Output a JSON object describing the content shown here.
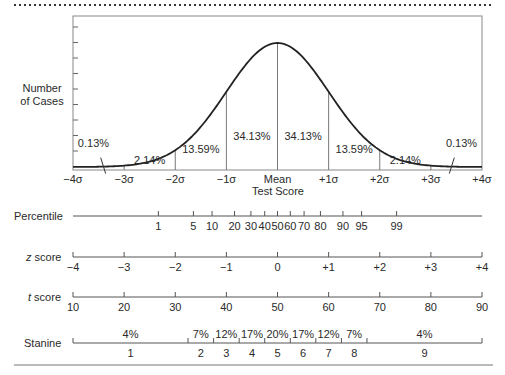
{
  "chart_data": {
    "type": "line",
    "title": "",
    "xlabel": "Test Score",
    "ylabel": "Number of Cases",
    "ylabel_lines": [
      "Number",
      "of Cases"
    ],
    "xlim": [
      -4,
      4
    ],
    "x_ticks": [
      "−4σ",
      "−3σ",
      "−2σ",
      "−1σ",
      "Mean",
      "+1σ",
      "+2σ",
      "+3σ",
      "+4σ"
    ],
    "x_tick_values": [
      -4,
      -3,
      -2,
      -1,
      0,
      1,
      2,
      3,
      4
    ],
    "curve": "standard normal distribution",
    "area_percentages": [
      {
        "range": [
          -4,
          -3
        ],
        "label": "0.13%",
        "value": 0.13
      },
      {
        "range": [
          -3,
          -2
        ],
        "label": "2.14%",
        "value": 2.14
      },
      {
        "range": [
          -2,
          -1
        ],
        "label": "13.59%",
        "value": 13.59
      },
      {
        "range": [
          -1,
          0
        ],
        "label": "34.13%",
        "value": 34.13
      },
      {
        "range": [
          0,
          1
        ],
        "label": "34.13%",
        "value": 34.13
      },
      {
        "range": [
          1,
          2
        ],
        "label": "13.59%",
        "value": 13.59
      },
      {
        "range": [
          2,
          3
        ],
        "label": "2.14%",
        "value": 2.14
      },
      {
        "range": [
          3,
          4
        ],
        "label": "0.13%",
        "value": 0.13
      }
    ],
    "grid": false,
    "scales": {
      "percentile": {
        "label": "Percentile",
        "ticks": [
          {
            "label": "1",
            "z": -2.33
          },
          {
            "label": "5",
            "z": -1.645
          },
          {
            "label": "10",
            "z": -1.28
          },
          {
            "label": "20",
            "z": -0.84
          },
          {
            "label": "30",
            "z": -0.52
          },
          {
            "label": "40",
            "z": -0.25
          },
          {
            "label": "50",
            "z": 0
          },
          {
            "label": "60",
            "z": 0.25
          },
          {
            "label": "70",
            "z": 0.52
          },
          {
            "label": "80",
            "z": 0.84
          },
          {
            "label": "90",
            "z": 1.28
          },
          {
            "label": "95",
            "z": 1.645
          },
          {
            "label": "99",
            "z": 2.33
          }
        ]
      },
      "z_score": {
        "label_italic": "z",
        "label_rest": " score",
        "ticks": [
          "−4",
          "−3",
          "−2",
          "−1",
          "0",
          "+1",
          "+2",
          "+3",
          "+4"
        ]
      },
      "t_score": {
        "label_italic": "t",
        "label_rest": " score",
        "ticks": [
          "10",
          "20",
          "30",
          "40",
          "50",
          "60",
          "70",
          "80",
          "90"
        ]
      },
      "stanine": {
        "label": "Stanine",
        "bands": [
          {
            "stanine": "1",
            "percent": "4%",
            "z_from": -4,
            "z_to": -1.75
          },
          {
            "stanine": "2",
            "percent": "7%",
            "z_from": -1.75,
            "z_to": -1.25
          },
          {
            "stanine": "3",
            "percent": "12%",
            "z_from": -1.25,
            "z_to": -0.75
          },
          {
            "stanine": "4",
            "percent": "17%",
            "z_from": -0.75,
            "z_to": -0.25
          },
          {
            "stanine": "5",
            "percent": "20%",
            "z_from": -0.25,
            "z_to": 0.25
          },
          {
            "stanine": "6",
            "percent": "17%",
            "z_from": 0.25,
            "z_to": 0.75
          },
          {
            "stanine": "7",
            "percent": "12%",
            "z_from": 0.75,
            "z_to": 1.25
          },
          {
            "stanine": "8",
            "percent": "7%",
            "z_from": 1.25,
            "z_to": 1.75
          },
          {
            "stanine": "9",
            "percent": "4%",
            "z_from": 1.75,
            "z_to": 4
          }
        ]
      }
    }
  }
}
